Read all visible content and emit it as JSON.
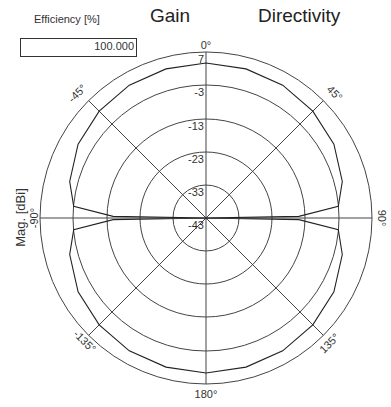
{
  "efficiency": {
    "label": "Efficiency [%]",
    "value": "100.000"
  },
  "tabs": {
    "gain": "Gain",
    "directivity": "Directivity"
  },
  "chart_data": {
    "type": "polar",
    "ylabel": "Mag. [dBi]",
    "radial_ticks": [
      "7",
      "-3",
      "-13",
      "-23",
      "-33",
      "-43"
    ],
    "radial_range": [
      -43,
      7
    ],
    "angle_ticks": [
      "0°",
      "45°",
      "90°",
      "135°",
      "180°",
      "-135°",
      "-90°",
      "-45°"
    ],
    "grid": true,
    "series": [
      {
        "name": "Pattern",
        "angles_deg": [
          0,
          15,
          30,
          45,
          60,
          75,
          85,
          89,
          90,
          91,
          95,
          105,
          120,
          135,
          150,
          165,
          180
        ],
        "values_dBi": [
          3.7,
          3.5,
          3.2,
          2.5,
          1.5,
          -0.5,
          -3,
          -15,
          -43,
          -15,
          -3,
          -0.5,
          1.5,
          2.5,
          3.2,
          3.5,
          3.7
        ]
      }
    ]
  },
  "labels": {
    "a0": "0°",
    "a45": "45°",
    "a90": "90°",
    "a135": "135°",
    "a180": "180°",
    "am135": "-135°",
    "am90": "-90°",
    "am45": "-45°",
    "r7": "7",
    "rm3": "-3",
    "rm13": "-13",
    "rm23": "-23",
    "rm33": "-33",
    "rm43": "-43"
  }
}
